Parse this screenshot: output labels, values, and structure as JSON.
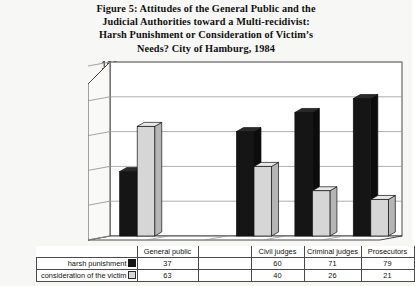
{
  "figure": {
    "title_lines": [
      "Figure 5:  Attitudes of the General Public and the",
      "Judicial Authorities toward a Multi-recidivist:",
      "Harsh Punishment or Consideration of Victim’s",
      "Needs? City of Hamburg, 1984"
    ]
  },
  "chart_data": {
    "type": "bar",
    "title": "Figure 5:  Attitudes of the General Public and the Judicial Authorities toward a Multi-recidivist: Harsh Punishment or Consideration of Victim’s Needs? City of Hamburg, 1984",
    "xlabel": "",
    "ylabel": "",
    "ylim": [
      0,
      100
    ],
    "yticks": [
      0,
      20,
      40,
      60,
      80,
      100
    ],
    "ytick_labels": [
      "0",
      "20",
      "40",
      "60",
      "80",
      "100"
    ],
    "grid": true,
    "legend_position": "table",
    "style": "3d-column",
    "categories": [
      "General public",
      "",
      "Civil judges",
      "Criminal judges",
      "Prosecutors"
    ],
    "series": [
      {
        "name": "harsh punishment",
        "color": "#151515",
        "values": [
          37,
          null,
          60,
          71,
          79
        ],
        "value_labels": [
          "37",
          "",
          "60",
          "71",
          "79"
        ]
      },
      {
        "name": "consideration of the victim",
        "color": "#d6d6d6",
        "values": [
          63,
          null,
          40,
          26,
          21
        ],
        "value_labels": [
          "63",
          "",
          "40",
          "26",
          "21"
        ]
      }
    ]
  },
  "table": {
    "column_headers": [
      "",
      "General public",
      "",
      "Civil judges",
      "Criminal judges",
      "Prosecutors"
    ],
    "rows": [
      {
        "label": "harsh punishment",
        "swatch": "dark-square-icon",
        "values": [
          "37",
          "",
          "60",
          "71",
          "79"
        ]
      },
      {
        "label": "consideration of the victim",
        "swatch": "light-square-icon",
        "values": [
          "63",
          "",
          "40",
          "26",
          "21"
        ]
      }
    ]
  },
  "colors": {
    "series_dark": "#151515",
    "series_light": "#d6d6d6",
    "axis": "#3a3a3a",
    "grid": "#9a9a9a",
    "background": "#f7f7f5",
    "plot_background": "#ffffff"
  }
}
